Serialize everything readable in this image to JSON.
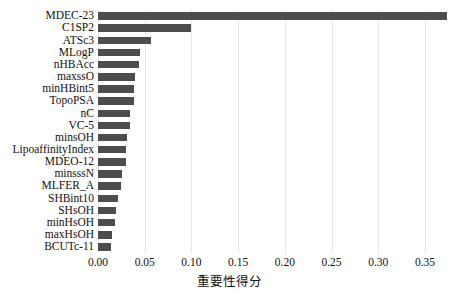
{
  "chart_data": {
    "type": "bar",
    "orientation": "horizontal",
    "title": "",
    "xlabel": "重要性得分",
    "ylabel": "",
    "xlim": [
      0.0,
      0.38
    ],
    "xticks": [
      "0.00",
      "0.05",
      "0.10",
      "0.15",
      "0.20",
      "0.25",
      "0.30",
      "0.35"
    ],
    "xtick_values": [
      0.0,
      0.05,
      0.1,
      0.15,
      0.2,
      0.25,
      0.3,
      0.35
    ],
    "grid": "vertical",
    "legend": "none",
    "bar_color": "#4d4d4d",
    "categories": [
      "MDEC-23",
      "C1SP2",
      "ATSc3",
      "MLogP",
      "nHBAcc",
      "maxssO",
      "minHBint5",
      "TopoPSA",
      "nC",
      "VC-5",
      "minsOH",
      "LipoaffinityIndex",
      "MDEO-12",
      "minsssN",
      "MLFER_A",
      "SHBint10",
      "SHsOH",
      "minHsOH",
      "maxHsOH",
      "BCUTc-11"
    ],
    "values": [
      0.374,
      0.0995,
      0.0565,
      0.0445,
      0.0435,
      0.0395,
      0.0385,
      0.038,
      0.0345,
      0.034,
      0.0315,
      0.03,
      0.0295,
      0.0255,
      0.025,
      0.0215,
      0.019,
      0.018,
      0.0155,
      0.014
    ]
  }
}
